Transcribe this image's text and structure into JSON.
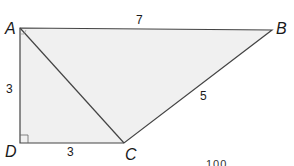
{
  "diagram": {
    "type": "trapezoid",
    "fill_color": "#f0f0f0",
    "stroke_color": "#444444",
    "vertices": {
      "A": {
        "label": "A",
        "x": 20,
        "y": 28
      },
      "B": {
        "label": "B",
        "x": 272,
        "y": 30
      },
      "C": {
        "label": "C",
        "x": 124,
        "y": 143
      },
      "D": {
        "label": "D",
        "x": 20,
        "y": 143
      }
    },
    "sides": {
      "AB": "7",
      "BC": "5",
      "DC": "3",
      "AD": "3"
    },
    "diagonal": "AC",
    "right_angle_at": "D",
    "partial_text": "100"
  }
}
